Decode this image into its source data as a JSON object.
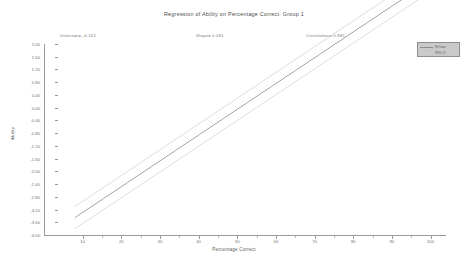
{
  "chart_data": {
    "type": "line",
    "title": "Regression of Ability on Percentage Correct.  Group 1",
    "xlabel": "Percentage Correct",
    "ylabel": "Ability",
    "xlim": [
      0,
      104
    ],
    "ylim": [
      -4.0,
      2.0
    ],
    "grid": false,
    "legend_position": "top-right",
    "x_ticks": [
      10,
      20,
      30,
      40,
      50,
      60,
      70,
      80,
      90,
      100
    ],
    "x_tick_labels": [
      "10",
      "20",
      "30",
      "40",
      "50",
      "60",
      "70",
      "80",
      "90",
      "100"
    ],
    "y_ticks": [
      2.0,
      1.6,
      1.2,
      0.8,
      0.4,
      0.0,
      -0.4,
      -0.8,
      -1.2,
      -1.6,
      -2.0,
      -2.4,
      -2.8,
      -3.2,
      -3.6,
      -4.0
    ],
    "y_tick_labels": [
      "2.00",
      "1.60",
      "1.20",
      "0.80",
      "0.40",
      "0.00",
      "-0.40",
      "-0.80",
      "-1.20",
      "-1.60",
      "-2.00",
      "-2.40",
      "-2.80",
      "-3.20",
      "-3.60",
      "-4.00"
    ],
    "regression": {
      "intercept": -4.102,
      "slope": 0.081,
      "correlation": 0.881
    },
    "series": [
      {
        "name": "Regression line",
        "role": "fit",
        "color": "#8c8c8c",
        "width": 0.8,
        "x": [
          8,
          100
        ],
        "y": [
          -3.454,
          3.998
        ]
      },
      {
        "name": "Upper confidence bound",
        "role": "confidence-upper",
        "color": "#cfcfcf",
        "width": 0.7,
        "x": [
          8,
          100
        ],
        "y": [
          -3.104,
          4.348
        ]
      },
      {
        "name": "Lower confidence bound",
        "role": "confidence-lower",
        "color": "#cfcfcf",
        "width": 0.7,
        "x": [
          8,
          100
        ],
        "y": [
          -3.804,
          3.648
        ]
      }
    ]
  },
  "header": {
    "title": "Regression of Ability on Percentage Correct.  Group 1"
  },
  "annotations": {
    "intercept": "Intercept= -4.102",
    "slope": "Slope= 0.081",
    "correlation": "Correlation= 0.881"
  },
  "legend": {
    "items": [
      {
        "label": "Fit Line",
        "color": "#8c8c8c"
      },
      {
        "label": "95% CI",
        "color": "#cfcfcf"
      }
    ]
  },
  "axes": {
    "x_title": "Percentage Correct",
    "y_title": "Ability"
  },
  "colors": {
    "axis": "#9a9a9a",
    "text": "#6f6f6f",
    "fit_line": "#8c8c8c",
    "ci_line": "#cfcfcf",
    "legend_bg": "#c9c9c9",
    "background": "#ffffff"
  }
}
